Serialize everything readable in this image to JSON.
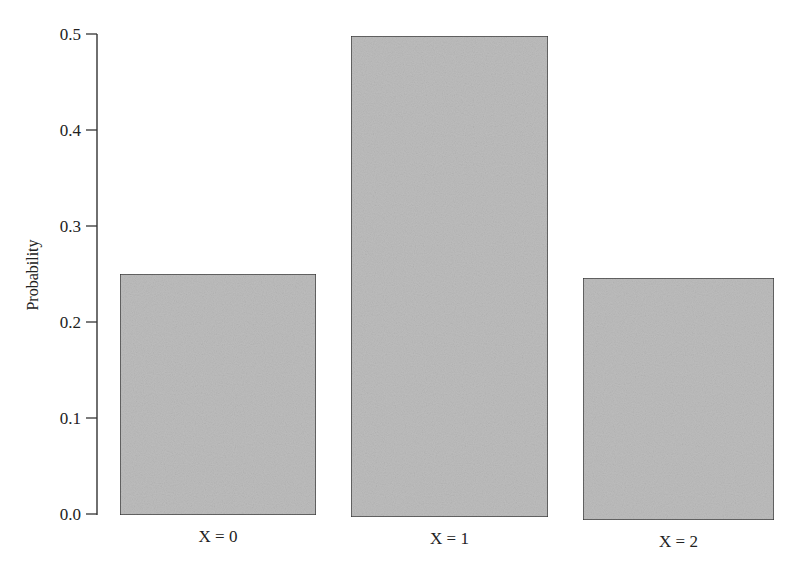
{
  "chart_data": {
    "type": "bar",
    "title": "",
    "xlabel": "",
    "ylabel": "Probability",
    "categories": [
      "X = 0",
      "X = 1",
      "X = 2"
    ],
    "values": [
      0.25,
      0.5,
      0.25
    ],
    "ylim": [
      0,
      0.5
    ],
    "yticks": [
      "0.0",
      "0.1",
      "0.2",
      "0.3",
      "0.4",
      "0.5"
    ],
    "grid": false,
    "legend": null,
    "bar_color": "#bdbdbd",
    "bar_edge_color": "#333333"
  }
}
